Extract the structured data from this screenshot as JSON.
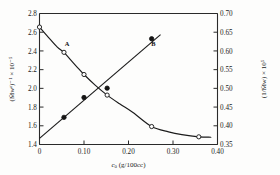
{
  "figure": {
    "background": "#fdfdfc",
    "frame_color": "#2a2a2a",
    "ink": "#1b1b1b"
  },
  "chart_data": {
    "type": "line",
    "title": "",
    "xlabel": "c₀ (g/100cc)",
    "ylabel_left": "(M̄wᵃ)⁻¹ × 10⁻⁵",
    "ylabel_right": "(1/M̄w) × 10⁵",
    "xlim": [
      0.0,
      0.4
    ],
    "ylim_left": [
      1.4,
      2.8
    ],
    "ylim_right": [
      0.35,
      0.7
    ],
    "xticks": [
      "0",
      "0.10",
      "0.20",
      "0.30",
      "0.40"
    ],
    "xtick_values": [
      0.0,
      0.1,
      0.2,
      0.3,
      0.4
    ],
    "yticks_left": [
      "1.4",
      "1.6",
      "1.8",
      "2.0",
      "2.2",
      "2.4",
      "2.6",
      "2.8"
    ],
    "ytick_values_left": [
      1.4,
      1.6,
      1.8,
      2.0,
      2.2,
      2.4,
      2.6,
      2.8
    ],
    "yticks_right": [
      "0.35",
      "0.40",
      "0.45",
      "0.50",
      "0.55",
      "0.60",
      "0.65",
      "0.70"
    ],
    "ytick_values_right": [
      0.35,
      0.4,
      0.45,
      0.5,
      0.55,
      0.6,
      0.65,
      0.7
    ],
    "grid": false,
    "legend_position": "inline-annotation",
    "series": [
      {
        "name": "A",
        "label": "A",
        "axis": "left",
        "marker": "open-circle",
        "marker_fill": "#ffffff",
        "marker_edge": "#1b1b1b",
        "line_style": "solid-curve",
        "annotation_xy": [
          0.062,
          2.45
        ],
        "x": [
          0.0,
          0.055,
          0.1,
          0.152,
          0.252,
          0.358
        ],
        "y": [
          2.655,
          2.385,
          2.148,
          1.928,
          1.592,
          1.482
        ],
        "curve_x": [
          0.0,
          0.02,
          0.04,
          0.055,
          0.07,
          0.085,
          0.1,
          0.125,
          0.152,
          0.18,
          0.21,
          0.252,
          0.29,
          0.32,
          0.358,
          0.385
        ],
        "curve_y": [
          2.655,
          2.545,
          2.44,
          2.385,
          2.305,
          2.225,
          2.148,
          2.035,
          1.928,
          1.835,
          1.742,
          1.592,
          1.535,
          1.505,
          1.482,
          1.478
        ]
      },
      {
        "name": "B",
        "label": "B",
        "axis": "right",
        "marker": "filled-circle",
        "marker_fill": "#141414",
        "marker_edge": "#141414",
        "line_style": "solid-straight",
        "annotation_xy": [
          0.256,
          0.612
        ],
        "x": [
          0.055,
          0.1,
          0.152,
          0.252
        ],
        "y": [
          0.4225,
          0.4755,
          0.5005,
          0.6325
        ],
        "line_endpoints_x": [
          0.0,
          0.272
        ],
        "line_endpoints_y": [
          0.3665,
          0.6435
        ]
      }
    ]
  }
}
